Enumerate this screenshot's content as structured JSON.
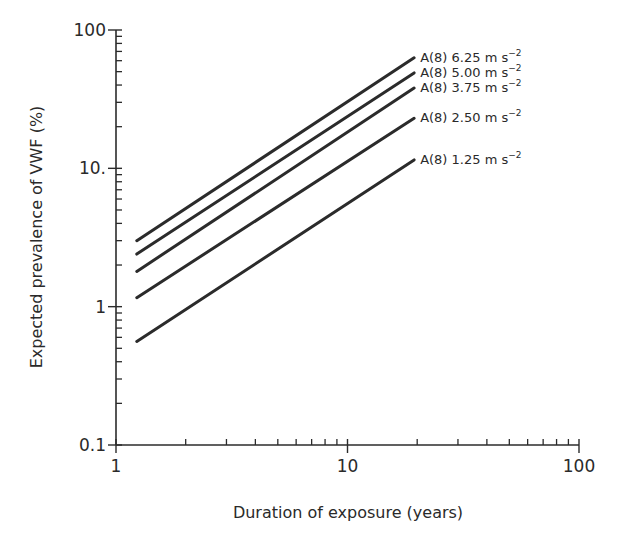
{
  "chart_data": {
    "type": "line",
    "title": "",
    "xlabel": "Duration of exposure (years)",
    "ylabel": "Expected prevalence of VWF (%)",
    "xscale": "log",
    "yscale": "log",
    "xlim": [
      1,
      100
    ],
    "ylim": [
      0.1,
      100
    ],
    "x_ticks": [
      {
        "value": 1,
        "label": "1"
      },
      {
        "value": 10,
        "label": "10"
      },
      {
        "value": 100,
        "label": "100"
      }
    ],
    "y_ticks": [
      {
        "value": 0.1,
        "label": "0.1"
      },
      {
        "value": 1,
        "label": "1"
      },
      {
        "value": 10,
        "label": "10."
      },
      {
        "value": 100,
        "label": "100"
      }
    ],
    "grid": false,
    "legend_position": "inline-right-of-lines",
    "series": [
      {
        "name": "A(8) 6.25 m s⁻²",
        "label_main": "A(8) 6.25 m s",
        "label_sup": "−2",
        "x": [
          1.23,
          19.4
        ],
        "values": [
          3.0,
          63
        ]
      },
      {
        "name": "A(8) 5.00 m s⁻²",
        "label_main": "A(8) 5.00 m s",
        "label_sup": "−2",
        "x": [
          1.23,
          19.4
        ],
        "values": [
          2.4,
          49
        ]
      },
      {
        "name": "A(8) 3.75 m s⁻²",
        "label_main": "A(8) 3.75 m s",
        "label_sup": "−2",
        "x": [
          1.23,
          19.4
        ],
        "values": [
          1.8,
          38
        ]
      },
      {
        "name": "A(8) 2.50 m s⁻²",
        "label_main": "A(8) 2.50 m s",
        "label_sup": "−2",
        "x": [
          1.23,
          19.4
        ],
        "values": [
          1.16,
          23
        ]
      },
      {
        "name": "A(8) 1.25 m s⁻²",
        "label_main": "A(8) 1.25 m s",
        "label_sup": "−2",
        "x": [
          1.23,
          19.4
        ],
        "values": [
          0.56,
          11.5
        ]
      }
    ]
  },
  "style": {
    "line_color": "#2b2b2b",
    "axis_color": "#2b2b2b",
    "background": "#ffffff"
  }
}
